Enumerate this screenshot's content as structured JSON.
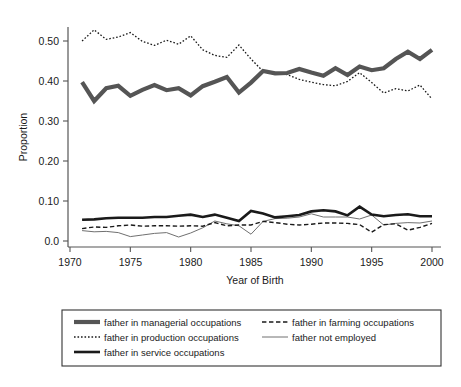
{
  "chart_data": {
    "type": "line",
    "title": "",
    "xlabel": "Year of Birth",
    "ylabel": "Proportion",
    "xlim": [
      1970,
      2000
    ],
    "ylim": [
      0.0,
      0.55
    ],
    "grid": false,
    "legend_position": "below-plot",
    "xticks": [
      1970,
      1975,
      1980,
      1985,
      1990,
      1995,
      2000
    ],
    "xtick_labels": [
      "1970",
      "1975",
      "1980",
      "1985",
      "1990",
      "1995",
      "2000"
    ],
    "yticks": [
      0.0,
      0.1,
      0.2,
      0.3,
      0.4,
      0.5
    ],
    "ytick_labels": [
      "0.0",
      "0.10",
      "0.20",
      "0.30",
      "0.40",
      "0.50"
    ],
    "x": [
      1971,
      1972,
      1973,
      1974,
      1975,
      1976,
      1977,
      1978,
      1979,
      1980,
      1981,
      1982,
      1983,
      1984,
      1985,
      1986,
      1987,
      1988,
      1989,
      1990,
      1991,
      1992,
      1993,
      1994,
      1995,
      1996,
      1997,
      1998,
      1999,
      2000
    ],
    "series": [
      {
        "name": "father in managerial occupations",
        "style": "thick-solid-gray",
        "color": "#555555",
        "values": [
          0.397,
          0.35,
          0.382,
          0.388,
          0.363,
          0.378,
          0.39,
          0.377,
          0.382,
          0.364,
          0.387,
          0.398,
          0.41,
          0.371,
          0.396,
          0.425,
          0.419,
          0.42,
          0.43,
          0.421,
          0.413,
          0.432,
          0.415,
          0.436,
          0.427,
          0.432,
          0.455,
          0.473,
          0.455,
          0.478
        ]
      },
      {
        "name": "father in production occupations",
        "style": "dotted",
        "color": "#1a1a1a",
        "values": [
          0.5,
          0.528,
          0.504,
          0.51,
          0.521,
          0.499,
          0.489,
          0.502,
          0.492,
          0.513,
          0.478,
          0.464,
          0.459,
          0.49,
          0.455,
          0.424,
          0.421,
          0.416,
          0.404,
          0.397,
          0.391,
          0.388,
          0.399,
          0.421,
          0.396,
          0.37,
          0.381,
          0.375,
          0.39,
          0.355
        ]
      },
      {
        "name": "father in service occupations",
        "style": "thick-solid-black",
        "color": "#1a1a1a",
        "values": [
          0.053,
          0.054,
          0.057,
          0.058,
          0.058,
          0.058,
          0.06,
          0.06,
          0.063,
          0.066,
          0.06,
          0.066,
          0.058,
          0.05,
          0.075,
          0.069,
          0.059,
          0.062,
          0.065,
          0.074,
          0.077,
          0.074,
          0.064,
          0.086,
          0.066,
          0.062,
          0.065,
          0.067,
          0.062,
          0.062
        ]
      },
      {
        "name": "father in farming occupations",
        "style": "dashed",
        "color": "#1a1a1a",
        "values": [
          0.031,
          0.035,
          0.034,
          0.038,
          0.04,
          0.037,
          0.038,
          0.038,
          0.037,
          0.038,
          0.037,
          0.046,
          0.038,
          0.04,
          0.04,
          0.049,
          0.046,
          0.042,
          0.04,
          0.042,
          0.045,
          0.045,
          0.044,
          0.041,
          0.022,
          0.041,
          0.043,
          0.027,
          0.034,
          0.044
        ]
      },
      {
        "name": "father not employed",
        "style": "thin-solid",
        "color": "#707070",
        "values": [
          0.026,
          0.023,
          0.024,
          0.021,
          0.011,
          0.015,
          0.019,
          0.021,
          0.01,
          0.02,
          0.033,
          0.05,
          0.043,
          0.038,
          0.017,
          0.049,
          0.056,
          0.057,
          0.06,
          0.068,
          0.06,
          0.06,
          0.06,
          0.055,
          0.065,
          0.04,
          0.044,
          0.046,
          0.045,
          0.05
        ]
      }
    ]
  },
  "legend": {
    "column_left": [
      {
        "label": "father in managerial occupations",
        "swatch": "thick-solid-gray"
      },
      {
        "label": "father in production occupations",
        "swatch": "dotted"
      },
      {
        "label": "father in service occupations",
        "swatch": "thick-solid-black"
      }
    ],
    "column_right": [
      {
        "label": "father in farming occupations",
        "swatch": "dashed"
      },
      {
        "label": "father not employed",
        "swatch": "thin-solid"
      }
    ]
  },
  "colors": {
    "managerial": "#555555",
    "production": "#1a1a1a",
    "service": "#1a1a1a",
    "farming": "#1a1a1a",
    "not_employed": "#707070",
    "axis": "#444444",
    "legend_border": "#333333",
    "background": "#ffffff"
  }
}
